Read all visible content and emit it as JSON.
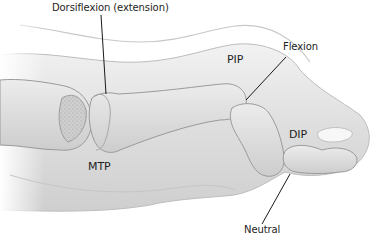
{
  "figure": {
    "labels": {
      "dorsiflexion": "Dorsiflexion (extension)",
      "pip": "PIP",
      "flexion": "Flexion",
      "dip": "DIP",
      "mtp": "MTP",
      "neutral": "Neutral"
    },
    "colors": {
      "skin_light": "#ebebeb",
      "skin_dark": "#c4c4c4",
      "bone": "#e0e0e0",
      "bone_outline": "#9a9a9a",
      "leader_line": "#1a1a1a",
      "background": "#ffffff"
    }
  }
}
